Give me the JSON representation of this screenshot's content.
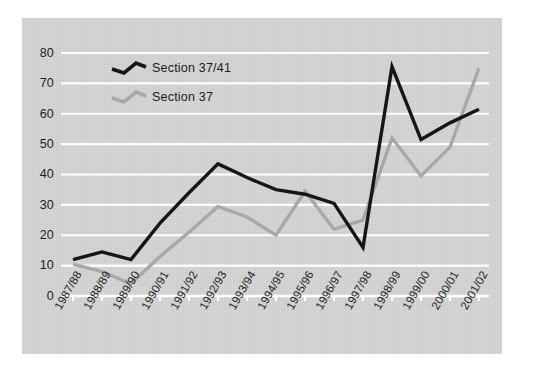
{
  "chart_data": {
    "type": "line",
    "title": "",
    "subtitle": "",
    "xlabel": "",
    "ylabel": "",
    "ylim": [
      0,
      80
    ],
    "yticks": [
      0,
      10,
      20,
      30,
      40,
      50,
      60,
      70,
      80
    ],
    "grid": true,
    "grid_color": "#ffffff",
    "legend_position": "top-left",
    "background_color": "#d4d4d4",
    "categories": [
      "1987/88",
      "1988/89",
      "1989/90",
      "1990/91",
      "1991/92",
      "1992/93",
      "1993/94",
      "1994/95",
      "1995/96",
      "1996/97",
      "1997/98",
      "1998/99",
      "1999/00",
      "2000/01",
      "2001/02"
    ],
    "series": [
      {
        "name": "Section 37/41",
        "color": "#161616",
        "values": [
          12,
          14.5,
          12,
          24,
          34,
          43.5,
          39,
          35,
          33.5,
          30.5,
          16,
          75.5,
          51.5,
          57,
          61.5
        ]
      },
      {
        "name": "Section 37",
        "color": "#a8a8a8",
        "values": [
          10.5,
          8,
          4,
          13,
          21,
          29.5,
          26,
          20,
          34.5,
          22,
          25,
          52,
          39.5,
          49,
          75
        ]
      }
    ]
  },
  "legend": {
    "items": [
      {
        "label": "Section 37/41",
        "color": "#161616"
      },
      {
        "label": "Section 37",
        "color": "#a8a8a8"
      }
    ]
  },
  "axes": {
    "y_tick_labels": [
      "80",
      "70",
      "60",
      "50",
      "40",
      "30",
      "20",
      "10",
      "0"
    ],
    "x_tick_labels": [
      "1987/88",
      "1988/89",
      "1989/90",
      "1990/91",
      "1991/92",
      "1992/93",
      "1993/94",
      "1994/95",
      "1995/96",
      "1996/97",
      "1997/98",
      "1998/99",
      "1999/00",
      "2000/01",
      "2001/02"
    ]
  }
}
